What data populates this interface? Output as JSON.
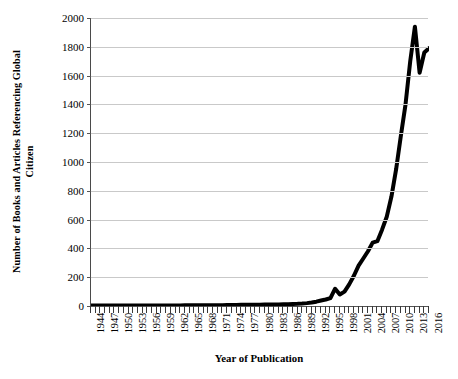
{
  "chart_data": {
    "type": "line",
    "title": "",
    "xlabel": "Year of Publication",
    "ylabel": "Number of Books and Articles Referencing Global Citizen",
    "ylabel_line1": "Number of Books and Articles Referencing Global",
    "ylabel_line2": "Citizen",
    "xlim": [
      1944,
      2016
    ],
    "ylim": [
      0,
      2000
    ],
    "y_ticks": [
      0,
      200,
      400,
      600,
      800,
      1000,
      1200,
      1400,
      1600,
      1800,
      2000
    ],
    "y_tick_labels": [
      "0",
      "200",
      "400",
      "600",
      "800",
      "1000",
      "1200",
      "1400",
      "1600",
      "1800",
      "2000"
    ],
    "x_tick_labels": [
      "1944",
      "1947",
      "1950",
      "1953",
      "1956",
      "1959",
      "1962",
      "1965",
      "1968",
      "1971",
      "1974",
      "1977",
      "1980",
      "1983",
      "1986",
      "1989",
      "1992",
      "1995",
      "1998",
      "2001",
      "2004",
      "2007",
      "2010",
      "2013",
      "2016"
    ],
    "x_tick_label_step": 3,
    "grid": true,
    "grid_axis": "y",
    "legend": false,
    "line_color": "#000000",
    "line_width": 4,
    "x": [
      1944,
      1945,
      1946,
      1947,
      1948,
      1949,
      1950,
      1951,
      1952,
      1953,
      1954,
      1955,
      1956,
      1957,
      1958,
      1959,
      1960,
      1961,
      1962,
      1963,
      1964,
      1965,
      1966,
      1967,
      1968,
      1969,
      1970,
      1971,
      1972,
      1973,
      1974,
      1975,
      1976,
      1977,
      1978,
      1979,
      1980,
      1981,
      1982,
      1983,
      1984,
      1985,
      1986,
      1987,
      1988,
      1989,
      1990,
      1991,
      1992,
      1993,
      1994,
      1995,
      1996,
      1997,
      1998,
      1999,
      2000,
      2001,
      2002,
      2003,
      2004,
      2005,
      2006,
      2007,
      2008,
      2009,
      2010,
      2011,
      2012,
      2013,
      2014,
      2015,
      2016
    ],
    "values": [
      3,
      3,
      3,
      3,
      3,
      3,
      3,
      3,
      3,
      3,
      3,
      3,
      3,
      4,
      4,
      4,
      4,
      4,
      4,
      4,
      5,
      5,
      5,
      5,
      5,
      6,
      6,
      6,
      6,
      7,
      7,
      7,
      8,
      8,
      8,
      9,
      9,
      10,
      10,
      11,
      11,
      12,
      13,
      14,
      15,
      17,
      20,
      24,
      30,
      38,
      45,
      55,
      120,
      80,
      100,
      150,
      210,
      280,
      330,
      380,
      440,
      450,
      530,
      620,
      760,
      950,
      1180,
      1400,
      1700,
      1940,
      1620,
      1760,
      1790
    ],
    "series": [
      {
        "name": "Books and Articles Referencing Global Citizen",
        "values": [
          3,
          3,
          3,
          3,
          3,
          3,
          3,
          3,
          3,
          3,
          3,
          3,
          3,
          4,
          4,
          4,
          4,
          4,
          4,
          4,
          5,
          5,
          5,
          5,
          5,
          6,
          6,
          6,
          6,
          7,
          7,
          7,
          8,
          8,
          8,
          9,
          9,
          10,
          10,
          11,
          11,
          12,
          13,
          14,
          15,
          17,
          20,
          24,
          30,
          38,
          45,
          55,
          120,
          80,
          100,
          150,
          210,
          280,
          330,
          380,
          440,
          450,
          530,
          620,
          760,
          950,
          1180,
          1400,
          1700,
          1940,
          1620,
          1760,
          1790
        ]
      }
    ],
    "annotations": [
      {
        "label": "peak",
        "x": 2013,
        "y": 1940
      },
      {
        "label": "local-bump",
        "x": 1996,
        "y": 120
      },
      {
        "label": "plateau",
        "x": 2005,
        "y": 450
      },
      {
        "label": "dip",
        "x": 2014,
        "y": 1620
      }
    ],
    "colors": {
      "line": "#000000",
      "grid": "#c9c9c9",
      "axis": "#555555",
      "text": "#000000",
      "background": "#ffffff"
    }
  }
}
